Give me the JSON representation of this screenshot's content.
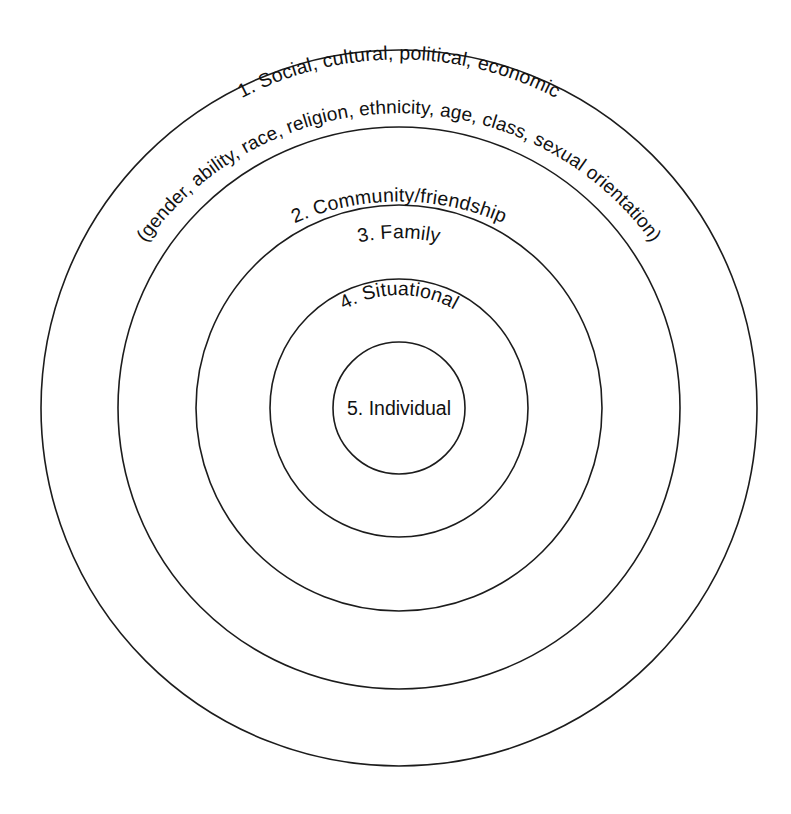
{
  "diagram": {
    "type": "concentric-circles",
    "title": "",
    "background_color": "#ffffff",
    "stroke_color": "#1c1c1c",
    "text_color": "#111111",
    "center": {
      "x": 399,
      "y": 408
    },
    "levels": [
      {
        "number": "1",
        "label": "1. Social, cultural, political, economic",
        "sublabel": "(gender, ability, race, religion, ethnicity, age, class, sexual orientation)",
        "radius": 358,
        "text_placement": "curved-top"
      },
      {
        "number": "2",
        "label": "2. Community/friendship",
        "sublabel": "",
        "radius": 281,
        "text_placement": "curved-top"
      },
      {
        "number": "3",
        "label": "3. Family",
        "sublabel": "",
        "radius": 203,
        "text_placement": "curved-top"
      },
      {
        "number": "4",
        "label": "4. Situational",
        "sublabel": "",
        "radius": 129,
        "text_placement": "curved-top"
      },
      {
        "number": "5",
        "label": "5. Individual",
        "sublabel": "",
        "radius": 66,
        "text_placement": "center"
      }
    ]
  },
  "chart_data": {
    "type": "diagram",
    "subtype": "concentric-circles",
    "title": "",
    "categories": [
      "1. Social, cultural, political, economic",
      "2. Community/friendship",
      "3. Family",
      "4. Situational",
      "5. Individual"
    ],
    "values": [
      358,
      281,
      203,
      129,
      66
    ],
    "annotations": [
      "(gender, ability, race, religion, ethnicity, age, class, sexual orientation)"
    ],
    "xlabel": "",
    "ylabel": "",
    "legend": "none",
    "grid": false
  }
}
